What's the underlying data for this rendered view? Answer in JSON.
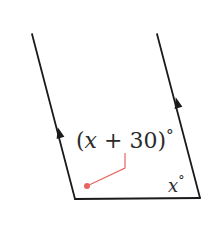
{
  "diagram": {
    "type": "parallel-lines-angles",
    "colors": {
      "line": "#1a1a1a",
      "leader": "#e8655f",
      "text": "#2b2b2b",
      "background": "#ffffff"
    },
    "lines": {
      "left_parallel": {
        "x1": 32,
        "y1": 34,
        "x2": 75,
        "y2": 199
      },
      "right_parallel": {
        "x1": 157,
        "y1": 34,
        "x2": 200,
        "y2": 198
      },
      "transversal": {
        "x1": 75,
        "y1": 199,
        "x2": 200,
        "y2": 198
      }
    },
    "parallel_arrow_marks": 2,
    "angle_labels": {
      "left_angle": {
        "open_paren": "(",
        "variable": "x",
        "operator": " + ",
        "constant": "30",
        "close_paren": ")",
        "degree": "°"
      },
      "right_angle": {
        "variable": "x",
        "degree": "°"
      }
    },
    "leader": {
      "points": "125,153 125,168 87,186",
      "dot": {
        "cx": 87,
        "cy": 186,
        "r": 3
      }
    }
  }
}
